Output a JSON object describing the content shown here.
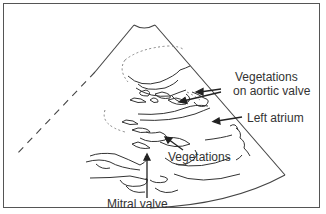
{
  "figure": {
    "type": "echocardiogram-schematic",
    "labels": {
      "vegetations_aortic_line1": "Vegetations",
      "vegetations_aortic_line2": "on aortic valve",
      "left_atrium": "Left atrium",
      "vegetations": "Vegetations",
      "mitral_valve": "Mitral valve"
    },
    "colors": {
      "line": "#333333",
      "frame": "#555555",
      "background": "#ffffff"
    }
  }
}
